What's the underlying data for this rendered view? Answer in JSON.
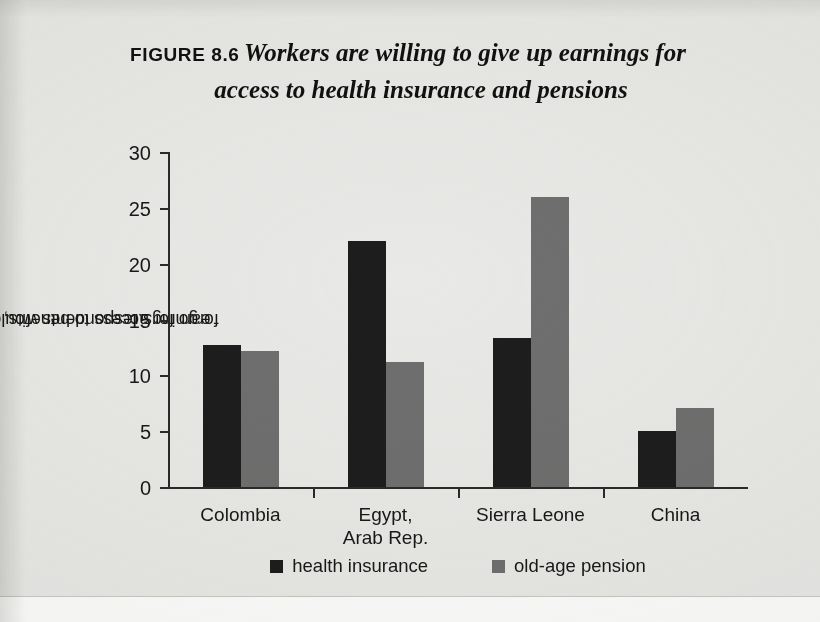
{
  "figure": {
    "label": "FIGURE 8.6",
    "headline_line1": "Workers are willing to give up earnings for",
    "headline_line2": "access to health insurance and pensions"
  },
  "colors": {
    "series_health_insurance": "#1d1d1d",
    "series_old_age_pension": "#6f6f6f",
    "axis": "#2a2a2a",
    "page_background": "#e9e9e7"
  },
  "chart_data": {
    "type": "bar",
    "title": "Workers are willing to give up earnings for access to health insurance and pensions",
    "xlabel": "",
    "ylabel": "earnings respondents would forgo for access to benefits, %",
    "ylabel_line1": "earnings respondents would",
    "ylabel_line2": "forgo for access to benefits, %",
    "ylim": [
      0,
      30
    ],
    "ytick_step": 5,
    "yticks": [
      0,
      5,
      10,
      15,
      20,
      25,
      30
    ],
    "ytick_labels": [
      "0",
      "5",
      "10",
      "15",
      "20",
      "25",
      "30"
    ],
    "grid": false,
    "legend_position": "bottom-center",
    "categories": [
      "Colombia",
      "Egypt, Arab Rep.",
      "Sierra Leone",
      "China"
    ],
    "category_labels": [
      "Colombia",
      "Egypt,\nArab Rep.",
      "Sierra Leone",
      "China"
    ],
    "series": [
      {
        "name": "health insurance",
        "color": "#1d1d1d",
        "values": [
          12.7,
          22.0,
          13.3,
          5.0
        ]
      },
      {
        "name": "old-age pension",
        "color": "#6f6f6f",
        "values": [
          12.2,
          11.2,
          26.0,
          7.1
        ]
      }
    ]
  }
}
